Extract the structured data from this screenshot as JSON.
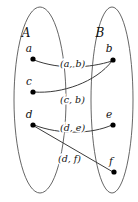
{
  "figure": {
    "width": 138,
    "height": 202,
    "background": "#ffffff",
    "stroke_color": "#555555",
    "edge_color": "#3a3a3a",
    "dot_color": "#000000"
  },
  "sets": [
    {
      "id": "A",
      "label": "A",
      "label_x": 26,
      "label_y": 37,
      "cx": 40,
      "cy": 100,
      "rx": 26,
      "ry": 93
    },
    {
      "id": "B",
      "label": "B",
      "label_x": 100,
      "label_y": 37,
      "cx": 112,
      "cy": 100,
      "rx": 21,
      "ry": 93
    }
  ],
  "nodes": [
    {
      "id": "a",
      "label": "a",
      "set": "A",
      "x": 33,
      "y": 59,
      "label_x": 29,
      "label_y": 52
    },
    {
      "id": "c",
      "label": "c",
      "set": "A",
      "x": 33,
      "y": 92,
      "label_x": 29,
      "label_y": 85
    },
    {
      "id": "d",
      "label": "d",
      "set": "A",
      "x": 33,
      "y": 125,
      "label_x": 29,
      "label_y": 118
    },
    {
      "id": "b",
      "label": "b",
      "set": "B",
      "x": 113,
      "y": 60,
      "label_x": 109,
      "label_y": 52
    },
    {
      "id": "e",
      "label": "e",
      "set": "B",
      "x": 113,
      "y": 125,
      "label_x": 109,
      "label_y": 118
    },
    {
      "id": "f",
      "label": "f",
      "set": "B",
      "x": 114,
      "y": 172,
      "label_x": 111,
      "label_y": 165
    }
  ],
  "edges": [
    {
      "id": "a-b",
      "from": "a",
      "to": "b",
      "label": "(a, b)",
      "label_open": "(",
      "label_first": "a",
      "label_comma": ", ",
      "label_second": "b",
      "label_close": ")",
      "label_x": 60,
      "label_y": 67,
      "path": "M 34 60 C 60 70 90 68 112 61"
    },
    {
      "id": "c-b",
      "from": "c",
      "to": "b",
      "label": "(c, b)",
      "label_open": "(",
      "label_first": "c",
      "label_comma": ", ",
      "label_second": "b",
      "label_close": ")",
      "label_x": 60,
      "label_y": 103,
      "path": "M 34 92 C 62 94 96 82 112 61"
    },
    {
      "id": "d-e",
      "from": "d",
      "to": "e",
      "label": "(d, e)",
      "label_open": "(",
      "label_first": "d",
      "label_comma": ", ",
      "label_second": "e",
      "label_close": ")",
      "label_x": 60,
      "label_y": 131,
      "path": "M 34 125 C 60 135 92 134 112 125"
    },
    {
      "id": "d-f",
      "from": "d",
      "to": "f",
      "label": "(d, f)",
      "label_open": "(",
      "label_first": "d",
      "label_comma": ", ",
      "label_second": "f",
      "label_close": ")",
      "label_x": 58,
      "label_y": 162,
      "path": "M 34 126 L 113 172"
    }
  ]
}
